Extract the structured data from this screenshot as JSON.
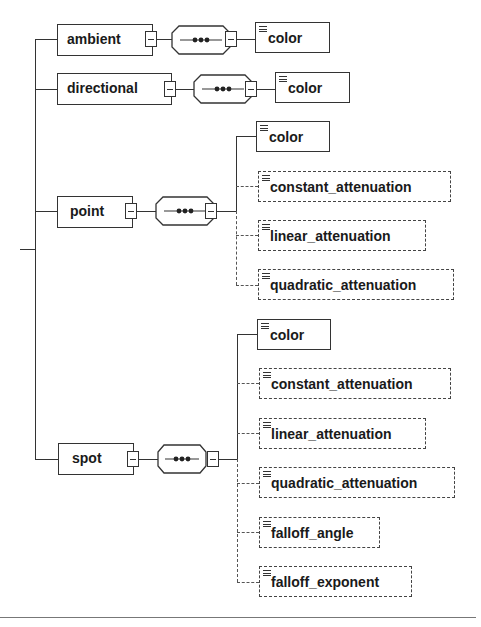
{
  "diagram": {
    "type": "xml-schema-content-model",
    "compositor_symbol": "sequence",
    "branches": [
      {
        "name": "ambient",
        "compositor": "sequence",
        "children": [
          {
            "name": "color",
            "optional": false
          }
        ]
      },
      {
        "name": "directional",
        "compositor": "sequence",
        "children": [
          {
            "name": "color",
            "optional": false
          }
        ]
      },
      {
        "name": "point",
        "compositor": "sequence",
        "children": [
          {
            "name": "color",
            "optional": false
          },
          {
            "name": "constant_attenuation",
            "optional": true
          },
          {
            "name": "linear_attenuation",
            "optional": true
          },
          {
            "name": "quadratic_attenuation",
            "optional": true
          }
        ]
      },
      {
        "name": "spot",
        "compositor": "sequence",
        "children": [
          {
            "name": "color",
            "optional": false
          },
          {
            "name": "constant_attenuation",
            "optional": true
          },
          {
            "name": "linear_attenuation",
            "optional": true
          },
          {
            "name": "quadratic_attenuation",
            "optional": true
          },
          {
            "name": "falloff_angle",
            "optional": true
          },
          {
            "name": "falloff_exponent",
            "optional": true
          }
        ]
      }
    ]
  },
  "colors": {
    "line": "#333333",
    "background": "#ffffff",
    "text": "#1a1a1a"
  }
}
